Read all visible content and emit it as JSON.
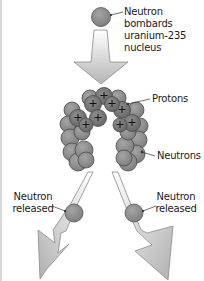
{
  "diagram": {
    "labels": {
      "incoming": [
        "Neutron",
        "bombards",
        "uranium-235",
        "nucleus"
      ],
      "protons": "Protons",
      "neutrons": "Neutrons",
      "released_left": [
        "Neutron",
        "released"
      ],
      "released_right": [
        "Neutron",
        "released"
      ]
    },
    "colors": {
      "neutron_fill": "#8c8c8c",
      "proton_fill": "#7a7a7a",
      "nucleon_stroke": "#4a4a4a",
      "arrow_light": "#f2f2f2",
      "arrow_dark": "#b8b8b8",
      "text": "#1a1a1a",
      "leader_line": "#333333"
    }
  }
}
